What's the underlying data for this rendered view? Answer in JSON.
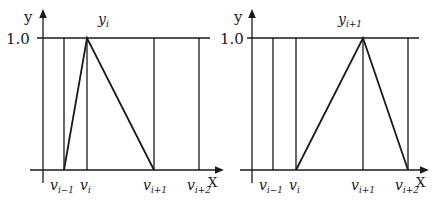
{
  "diagrams": [
    {
      "id": "left",
      "title": "y",
      "title_sub": "i",
      "y_axis_label": "y",
      "x_axis_label": "X",
      "y_tick_label": "1.0",
      "node_labels": [
        {
          "base": "v",
          "sub": "i−1"
        },
        {
          "base": "v",
          "sub": "i"
        },
        {
          "base": "v",
          "sub": "i+1"
        },
        {
          "base": "v",
          "sub": "i+2"
        }
      ],
      "hat_function": "peak at v_i, zero at v_{i-1} and v_{i+1}"
    },
    {
      "id": "right",
      "title": "y",
      "title_sub": "i+1",
      "y_axis_label": "y",
      "x_axis_label": "X",
      "y_tick_label": "1.0",
      "node_labels": [
        {
          "base": "v",
          "sub": "i−1"
        },
        {
          "base": "v",
          "sub": "i"
        },
        {
          "base": "v",
          "sub": "i+1"
        },
        {
          "base": "v",
          "sub": "i+2"
        }
      ],
      "hat_function": "peak at v_{i+1}, zero at v_i and v_{i+2}"
    }
  ]
}
